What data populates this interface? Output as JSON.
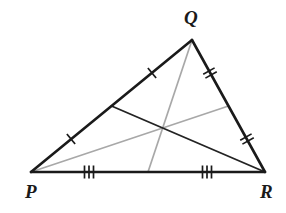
{
  "figure": {
    "kind": "geometry-diagram",
    "background_color": "#ffffff"
  },
  "colors": {
    "edge_stroke": "#1a1a1a",
    "median_dark_stroke": "#232323",
    "median_gray_stroke": "#a8a8a8",
    "tick_stroke": "#1a1a1a",
    "label_color": "#1a1a1a"
  },
  "strokes": {
    "edge_width": 2.6,
    "median_dark_width": 1.7,
    "median_gray_width": 1.7,
    "tick_width": 1.7
  },
  "vertices": [
    {
      "name": "Q",
      "label": "Q",
      "x": 192,
      "y": 40,
      "label_x": 184,
      "label_y": 8
    },
    {
      "name": "P",
      "label": "P",
      "x": 31,
      "y": 172,
      "label_x": 25,
      "label_y": 182
    },
    {
      "name": "R",
      "label": "R",
      "x": 265,
      "y": 172,
      "label_x": 260,
      "label_y": 182
    }
  ],
  "edges": [
    {
      "name": "side-PQ",
      "from": "P",
      "to": "Q",
      "x1": 31,
      "y1": 172,
      "x2": 192,
      "y2": 40,
      "color": "#1a1a1a"
    },
    {
      "name": "side-QR",
      "from": "Q",
      "to": "R",
      "x1": 192,
      "y1": 40,
      "x2": 265,
      "y2": 172,
      "color": "#1a1a1a"
    },
    {
      "name": "side-PR",
      "from": "P",
      "to": "R",
      "x1": 31,
      "y1": 172,
      "x2": 265,
      "y2": 172,
      "color": "#1a1a1a"
    }
  ],
  "midpoints": [
    {
      "name": "midpoint-PQ",
      "on_side": "PQ",
      "x": 111.5,
      "y": 106
    },
    {
      "name": "midpoint-QR",
      "on_side": "QR",
      "x": 228.5,
      "y": 106
    },
    {
      "name": "midpoint-PR",
      "on_side": "PR",
      "x": 148,
      "y": 172
    }
  ],
  "centroid": {
    "name": "centroid",
    "x": 162,
    "y": 128
  },
  "medians": [
    {
      "name": "median-from-R",
      "from": "R",
      "to": "midpoint-PQ",
      "x1": 265,
      "y1": 172,
      "x2": 111.5,
      "y2": 106,
      "color": "#232323",
      "width": 1.9
    },
    {
      "name": "median-from-P",
      "from": "P",
      "to": "midpoint-QR",
      "x1": 31,
      "y1": 172,
      "x2": 228.5,
      "y2": 106,
      "color": "#a8a8a8",
      "width": 1.7
    },
    {
      "name": "median-from-Q",
      "from": "Q",
      "to": "midpoint-PR",
      "x1": 192,
      "y1": 40,
      "x2": 148,
      "y2": 172,
      "color": "#a8a8a8",
      "width": 1.7
    }
  ],
  "tick_marks": [
    {
      "name": "tick-PQ-upper",
      "segment": "Q-to-midpoint-PQ",
      "count": 1,
      "x": 152,
      "y": 73,
      "angle_deg": -39.3,
      "length": 13,
      "spacing": 4
    },
    {
      "name": "tick-PQ-lower",
      "segment": "P-to-midpoint-PQ",
      "count": 1,
      "x": 71,
      "y": 139,
      "angle_deg": -39.3,
      "length": 13,
      "spacing": 4
    },
    {
      "name": "tick-QR-upper",
      "segment": "Q-to-midpoint-QR",
      "count": 2,
      "x": 210,
      "y": 73,
      "angle_deg": 61.0,
      "length": 13,
      "spacing": 4.5
    },
    {
      "name": "tick-QR-lower",
      "segment": "R-to-midpoint-QR",
      "count": 2,
      "x": 247,
      "y": 139,
      "angle_deg": 61.0,
      "length": 13,
      "spacing": 4.5
    },
    {
      "name": "tick-PR-left",
      "segment": "P-to-midpoint-PR",
      "count": 3,
      "x": 89,
      "y": 172,
      "angle_deg": 0,
      "length": 13,
      "spacing": 4.5
    },
    {
      "name": "tick-PR-right",
      "segment": "R-to-midpoint-PR",
      "count": 3,
      "x": 207,
      "y": 172,
      "angle_deg": 0,
      "length": 13,
      "spacing": 4.5
    }
  ],
  "labels": {
    "Q": "Q",
    "P": "P",
    "R": "R"
  }
}
